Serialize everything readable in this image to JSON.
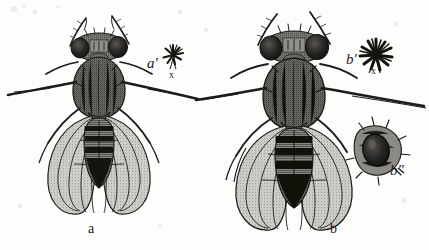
{
  "figure": {
    "kind": "scientific-illustration",
    "background_color": "#fdfdfc",
    "ink_color": "#1a1a1a"
  },
  "labels": {
    "left_specimen": "a",
    "left_detail": "a′",
    "left_detail_sub": "x",
    "right_specimen": "b",
    "right_detail": "b′",
    "right_detail_sub": "x",
    "right_detail_two": "b″"
  },
  "specimens": [
    {
      "id": "a",
      "label": "a",
      "position": "left",
      "relative_size": "smaller",
      "detail_label": "a′",
      "detail_kind": "bristle-rosette",
      "detail_size": "small",
      "detail_marker": "x"
    },
    {
      "id": "b",
      "label": "b",
      "position": "right",
      "relative_size": "larger",
      "detail_label": "b′",
      "detail_kind": "bristle-rosette",
      "detail_size": "large",
      "detail_marker": "x",
      "extra_detail_label": "b″",
      "extra_detail_kind": "magnified-eye-inset"
    }
  ]
}
